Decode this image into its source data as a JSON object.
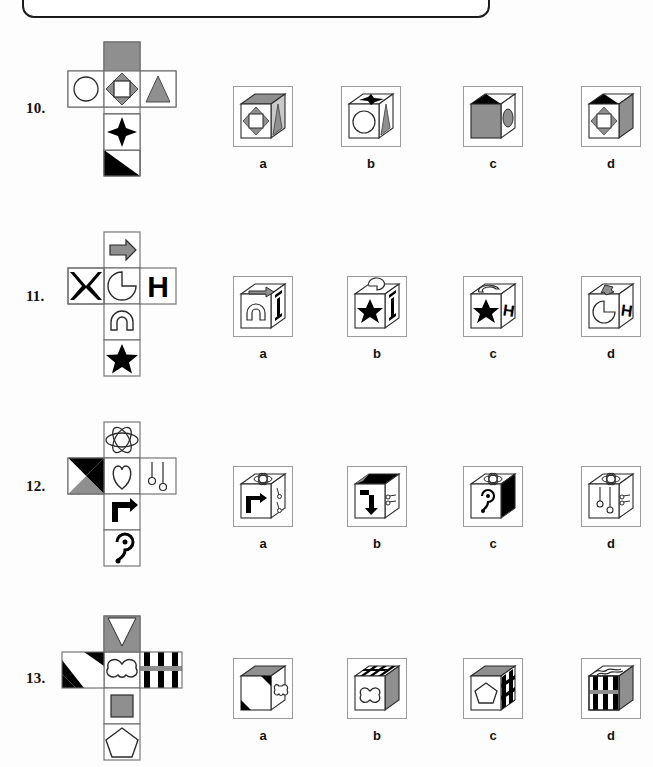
{
  "page": {
    "width": 653,
    "height": 767,
    "background": "#ffffff",
    "type": "cube-folding spatial-reasoning worksheet",
    "top_panel": {
      "name": "cut-off-rounded-panel",
      "text": ""
    }
  },
  "palette": {
    "ink": "#111111",
    "gray_fill": "#8f8f8f",
    "light_gray": "#c9c9c9",
    "box_border": "#9b9b9b",
    "white": "#ffffff",
    "black": "#000000"
  },
  "option_labels": [
    "a",
    "b",
    "c",
    "d"
  ],
  "questions": [
    {
      "number": "10.",
      "net": {
        "name": "cube-net-10",
        "faces": [
          {
            "pos": "top",
            "icon": "gray-rectangle",
            "fill": "#8f8f8f"
          },
          {
            "pos": "left",
            "icon": "circle-outline",
            "fill": "#ffffff"
          },
          {
            "pos": "center",
            "icon": "diamond-square-rosette",
            "fill": "#8f8f8f"
          },
          {
            "pos": "right",
            "icon": "gray-triangle",
            "fill": "#8f8f8f"
          },
          {
            "pos": "below-center",
            "icon": "four-point-star",
            "fill": "#000000"
          },
          {
            "pos": "bottom",
            "icon": "black-half-triangle",
            "fill": "#000000"
          }
        ]
      },
      "options": [
        {
          "label": "a",
          "faces": {
            "top": "gray-rectangle",
            "front": "diamond-square-rosette",
            "side": "gray-triangle"
          }
        },
        {
          "label": "b",
          "faces": {
            "top": "four-point-star",
            "front": "circle-outline",
            "side": "gray-triangle"
          }
        },
        {
          "label": "c",
          "faces": {
            "top": "black-half-triangle",
            "front": "gray-rectangle",
            "side": "gray-ellipse"
          }
        },
        {
          "label": "d",
          "faces": {
            "top": "black-half-triangle",
            "front": "diamond-square-rosette",
            "side": "gray-rectangle"
          }
        }
      ]
    },
    {
      "number": "11.",
      "net": {
        "name": "cube-net-11",
        "faces": [
          {
            "pos": "top",
            "icon": "gray-right-arrow",
            "fill": "#8f8f8f"
          },
          {
            "pos": "left",
            "icon": "black-x",
            "fill": "#000000"
          },
          {
            "pos": "center",
            "icon": "pacman-shape",
            "fill": "#ffffff"
          },
          {
            "pos": "right",
            "icon": "letter-h",
            "fill": "#000000"
          },
          {
            "pos": "below-center",
            "icon": "arch-shape",
            "fill": "#ffffff"
          },
          {
            "pos": "bottom",
            "icon": "black-star",
            "fill": "#000000"
          }
        ]
      },
      "options": [
        {
          "label": "a",
          "faces": {
            "top": "gray-right-arrow",
            "front": "arch-shape",
            "side": "letter-h-rotated"
          }
        },
        {
          "label": "b",
          "faces": {
            "top": "pacman-shape",
            "front": "black-star",
            "side": "letter-h-rotated"
          }
        },
        {
          "label": "c",
          "faces": {
            "top": "arch-shape",
            "front": "black-star",
            "side": "letter-h"
          }
        },
        {
          "label": "d",
          "faces": {
            "top": "gray-right-arrow",
            "front": "pacman-shape",
            "side": "letter-h"
          }
        }
      ]
    },
    {
      "number": "12.",
      "net": {
        "name": "cube-net-12",
        "faces": [
          {
            "pos": "top",
            "icon": "ellipse-rosette",
            "fill": "#ffffff"
          },
          {
            "pos": "left",
            "icon": "black-gray-triangle-pair",
            "fill": "#000000"
          },
          {
            "pos": "center",
            "icon": "heart-outline",
            "fill": "#ffffff"
          },
          {
            "pos": "right",
            "icon": "two-pins",
            "fill": "#ffffff"
          },
          {
            "pos": "below-center",
            "icon": "right-turn-arrow",
            "fill": "#000000"
          },
          {
            "pos": "bottom",
            "icon": "yin-yang-squiggle",
            "fill": "#000000"
          }
        ]
      },
      "options": [
        {
          "label": "a",
          "faces": {
            "top": "ellipse-rosette",
            "front": "right-turn-arrow",
            "side": "two-pins"
          }
        },
        {
          "label": "b",
          "faces": {
            "top": "black-gray-triangle-pair",
            "front": "down-turn-arrow",
            "side": "two-pins-rotated"
          }
        },
        {
          "label": "c",
          "faces": {
            "top": "ellipse-rosette",
            "front": "yin-yang-squiggle",
            "side": "black-gray-triangle-pair"
          }
        },
        {
          "label": "d",
          "faces": {
            "top": "ellipse-rosette",
            "front": "two-pins",
            "side": "two-pins-rotated"
          }
        }
      ]
    },
    {
      "number": "13.",
      "net": {
        "name": "cube-net-13",
        "faces": [
          {
            "pos": "top",
            "icon": "gray-with-white-triangle",
            "fill": "#8f8f8f"
          },
          {
            "pos": "left",
            "icon": "diagonal-black-stripes",
            "fill": "#000000"
          },
          {
            "pos": "center",
            "icon": "bowtie-outline",
            "fill": "#ffffff"
          },
          {
            "pos": "right",
            "icon": "vertical-black-stripes",
            "fill": "#000000"
          },
          {
            "pos": "below-center",
            "icon": "gray-square",
            "fill": "#8f8f8f"
          },
          {
            "pos": "bottom",
            "icon": "pentagon-outline",
            "fill": "#ffffff"
          }
        ]
      },
      "options": [
        {
          "label": "a",
          "faces": {
            "top": "gray-with-white-triangle",
            "front": "diagonal-black-stripes",
            "side": "bowtie-outline"
          }
        },
        {
          "label": "b",
          "faces": {
            "top": "vertical-black-stripes",
            "front": "bowtie-outline",
            "side": "gray-square"
          }
        },
        {
          "label": "c",
          "faces": {
            "top": "gray-square",
            "front": "pentagon-outline",
            "side": "vertical-black-stripes"
          }
        },
        {
          "label": "d",
          "faces": {
            "top": "bowtie-outline",
            "front": "vertical-black-stripes",
            "side": "gray-square"
          }
        }
      ]
    }
  ]
}
